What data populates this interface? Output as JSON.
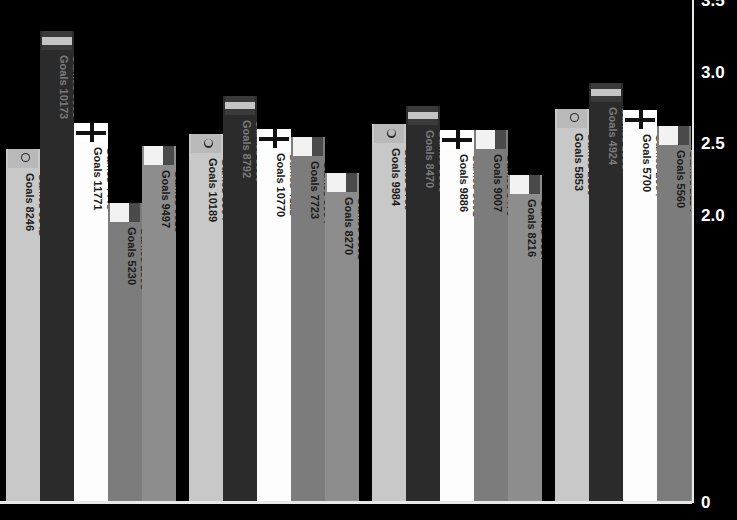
{
  "chart_data": {
    "type": "bar",
    "title": "",
    "subtitle": "",
    "xlabel": "",
    "ylabel": "",
    "ylim": [
      0,
      3.5
    ],
    "grid": false,
    "legend_position": "none",
    "y_ticks": [
      "3.5",
      "3.0",
      "2.5",
      "2.0",
      "0"
    ],
    "y_tick_values": [
      3.5,
      3.0,
      2.5,
      2.0,
      0
    ],
    "value_format": "goals per game",
    "annotation_labels": {
      "games_prefix": "Games",
      "goals_prefix": "Goals"
    },
    "groups": [
      {
        "group_index": 0,
        "bars": [
          {
            "value": "2.47",
            "value_num": 2.47,
            "games": "3342",
            "goals": "8246",
            "flag_icon": "flag-crescent-icon",
            "bar_color": "#c8c8c8",
            "flag_color": "#b9b9b9",
            "label_color": "#1a1a1a"
          },
          {
            "value": "3.29",
            "value_num": 3.29,
            "games": "3095",
            "goals": "10173",
            "flag_icon": "flag-horizontal-bands-icon",
            "bar_color": "#2b2b2b",
            "flag_color": "#c4c4c4",
            "label_color": "#7a7a7a"
          },
          {
            "value": "2.65",
            "value_num": 2.65,
            "games": "4448",
            "goals": "11771",
            "flag_icon": "flag-cross-icon",
            "bar_color": "#fdfdfd",
            "flag_color": "#ffffff",
            "label_color": "#1a1a1a"
          },
          {
            "value": "2.09",
            "value_num": 2.09,
            "games": "2506",
            "goals": "5230",
            "flag_icon": "flag-block-icon",
            "bar_color": "#7c7c7c",
            "flag_color": "#f2f2f2",
            "label_color": "#1a1a1a"
          },
          {
            "value": "2.49",
            "value_num": 2.49,
            "games": "3819",
            "goals": "9497",
            "flag_icon": "flag-block-icon",
            "bar_color": "#8d8d8d",
            "flag_color": "#f2f2f2",
            "label_color": "#1a1a1a"
          }
        ]
      },
      {
        "group_index": 1,
        "bars": [
          {
            "value": "2.57",
            "value_num": 2.57,
            "games": "3964",
            "goals": "10189",
            "flag_icon": "flag-crescent-icon",
            "bar_color": "#c8c8c8",
            "flag_color": "#b9b9b9",
            "label_color": "#1a1a1a"
          },
          {
            "value": "2.84",
            "value_num": 2.84,
            "games": "3099",
            "goals": "8792",
            "flag_icon": "flag-horizontal-bands-icon",
            "bar_color": "#2b2b2b",
            "flag_color": "#c4c4c4",
            "label_color": "#7a7a7a"
          },
          {
            "value": "2.61",
            "value_num": 2.61,
            "games": "4122",
            "goals": "10770",
            "flag_icon": "flag-cross-icon",
            "bar_color": "#fdfdfd",
            "flag_color": "#ffffff",
            "label_color": "#1a1a1a"
          },
          {
            "value": "2.55",
            "value_num": 2.55,
            "games": "3034",
            "goals": "7723",
            "flag_icon": "flag-block-icon",
            "bar_color": "#7c7c7c",
            "flag_color": "#f2f2f2",
            "label_color": "#1a1a1a"
          },
          {
            "value": "2.30",
            "value_num": 2.3,
            "games": "3601",
            "goals": "8270",
            "flag_icon": "flag-block-icon",
            "bar_color": "#8d8d8d",
            "flag_color": "#f2f2f2",
            "label_color": "#1a1a1a"
          }
        ]
      },
      {
        "group_index": 2,
        "bars": [
          {
            "value": "2.64",
            "value_num": 2.64,
            "games": "3780",
            "goals": "9984",
            "flag_icon": "flag-crescent-icon",
            "bar_color": "#c8c8c8",
            "flag_color": "#b9b9b9",
            "label_color": "#1a1a1a"
          },
          {
            "value": "2.77",
            "value_num": 2.77,
            "games": "3060",
            "goals": "8470",
            "flag_icon": "flag-horizontal-bands-icon",
            "bar_color": "#2b2b2b",
            "flag_color": "#c4c4c4",
            "label_color": "#7a7a7a"
          },
          {
            "value": "2.60",
            "value_num": 2.6,
            "games": "3801",
            "goals": "9886",
            "flag_icon": "flag-cross-icon",
            "bar_color": "#fdfdfd",
            "flag_color": "#ffffff",
            "label_color": "#1a1a1a"
          },
          {
            "value": "2.60",
            "value_num": 2.6,
            "games": "3470",
            "goals": "9007",
            "flag_icon": "flag-block-icon",
            "bar_color": "#7c7c7c",
            "flag_color": "#f2f2f2",
            "label_color": "#1a1a1a"
          },
          {
            "value": "2.29",
            "value_num": 2.29,
            "games": "3587",
            "goals": "8216",
            "flag_icon": "flag-block-icon",
            "bar_color": "#8d8d8d",
            "flag_color": "#f2f2f2",
            "label_color": "#1a1a1a"
          }
        ]
      },
      {
        "group_index": 3,
        "bars": [
          {
            "value": "2.75",
            "value_num": 2.75,
            "games": "2130",
            "goals": "5853",
            "flag_icon": "flag-crescent-icon",
            "bar_color": "#c8c8c8",
            "flag_color": "#b9b9b9",
            "label_color": "#1a1a1a"
          },
          {
            "value": "2.93",
            "value_num": 2.93,
            "games": "1683",
            "goals": "4924",
            "flag_icon": "flag-horizontal-bands-icon",
            "bar_color": "#2b2b2b",
            "flag_color": "#c4c4c4",
            "label_color": "#7a7a7a"
          },
          {
            "value": "2.74",
            "value_num": 2.74,
            "games": "2084",
            "goals": "5700",
            "flag_icon": "flag-cross-icon",
            "bar_color": "#fdfdfd",
            "flag_color": "#ffffff",
            "label_color": "#1a1a1a"
          },
          {
            "value": "2.63",
            "value_num": 2.63,
            "games": "2114",
            "goals": "5560",
            "flag_icon": "flag-block-icon",
            "bar_color": "#7c7c7c",
            "flag_color": "#f2f2f2",
            "label_color": "#1a1a1a"
          },
          {
            "value": "2.46",
            "value_num": 2.46,
            "games": "2093",
            "goals": "5144",
            "flag_icon": "flag-block-icon",
            "bar_color": "#8d8d8d",
            "flag_color": "#f2f2f2",
            "label_color": "#1a1a1a"
          }
        ]
      }
    ]
  },
  "colors": {
    "background": "#000000",
    "axis": "#e8e8e8",
    "value_label": "#ffffff"
  }
}
